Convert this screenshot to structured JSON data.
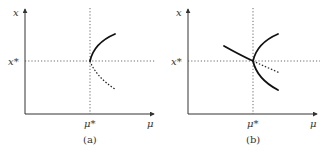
{
  "figure": {
    "panels": [
      {
        "id": "a",
        "caption": "(a)",
        "y_axis_label": "x",
        "x_axis_label": "μ",
        "x_star_label": "x*",
        "mu_star_label": "μ*",
        "description": "Saddle-node bifurcation: stable upper branch (solid) and unstable lower branch (dotted) meeting at (μ*, x*)"
      },
      {
        "id": "b",
        "caption": "(b)",
        "y_axis_label": "x",
        "x_axis_label": "μ",
        "x_star_label": "x*",
        "mu_star_label": "μ*",
        "description": "Transcritical/pitchfork-type bifurcation: solid parabola branches through (μ*, x*), a solid line from upper-left continuing as a dotted line to the right"
      }
    ]
  }
}
